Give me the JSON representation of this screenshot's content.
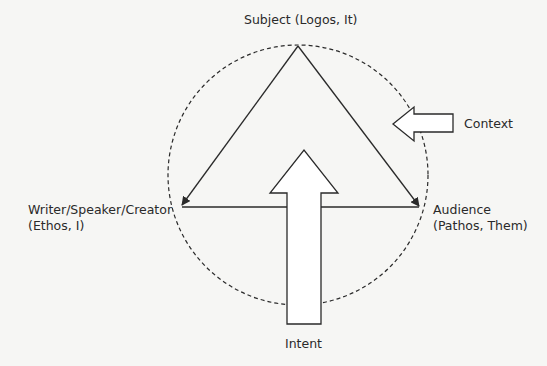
{
  "diagram": {
    "nodes": {
      "subject": {
        "line1": "Subject (Logos, It)"
      },
      "writer": {
        "line1": "Writer/Speaker/Creator",
        "line2": "(Ethos, I)"
      },
      "audience": {
        "line1": "Audience",
        "line2": "(Pathos, Them)"
      }
    },
    "arrows": {
      "context": {
        "label": "Context"
      },
      "intent": {
        "label": "Intent"
      }
    },
    "colors": {
      "stroke": "#2a2a2a",
      "background": "#f6f6f4",
      "arrow_fill": "#ffffff"
    }
  }
}
